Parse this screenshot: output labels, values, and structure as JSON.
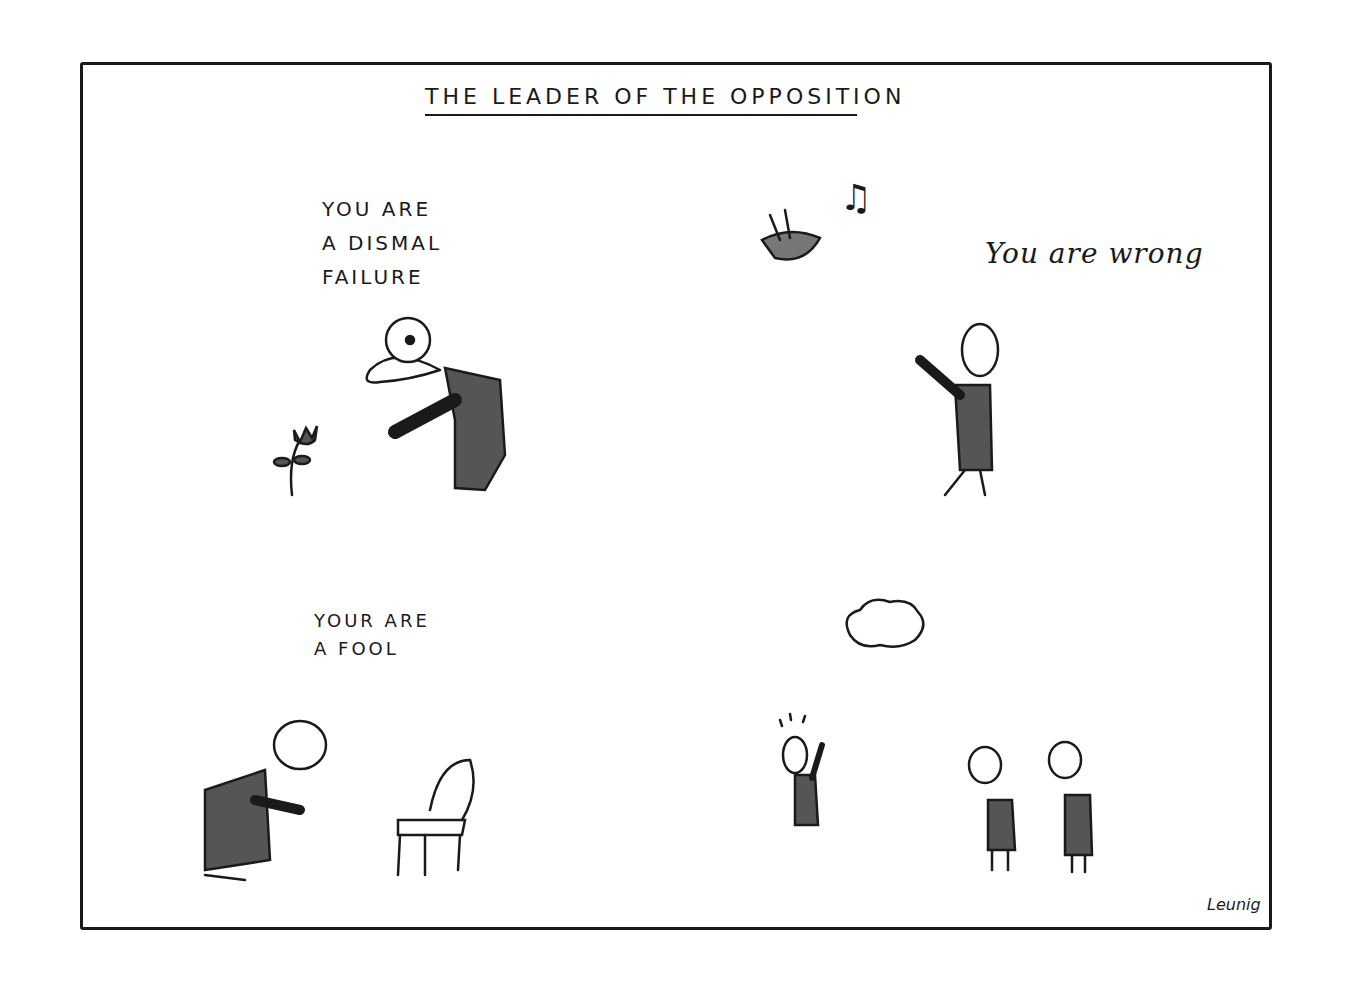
{
  "title": "THE LEADER OF THE OPPOSITION",
  "panels": [
    {
      "caption": "YOU ARE\nA DISMAL\nFAILURE",
      "subject": "flower"
    },
    {
      "caption": "You are wrong",
      "subject": "bird"
    },
    {
      "caption": "YOUR ARE\nA FOOL",
      "subject": "chair"
    },
    {
      "caption": "",
      "subject": "cloud"
    }
  ],
  "signature": "Leunig",
  "icons": {
    "music_note": "♫"
  }
}
